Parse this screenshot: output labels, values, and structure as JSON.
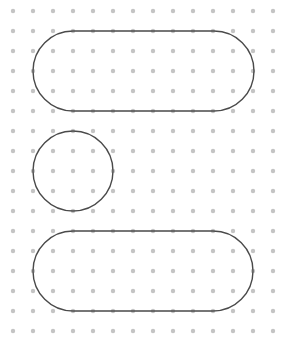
{
  "canvas": {
    "width": 287,
    "height": 346,
    "background": "#ffffff"
  },
  "grid": {
    "origin_x": 13,
    "origin_y": 11,
    "spacing": 20,
    "columns": 14,
    "rows": 17,
    "dot_radius": 2.2,
    "dot_color": "#c4c4c4"
  },
  "shapes": [
    {
      "type": "stadium",
      "name": "top-stadium",
      "x": 33,
      "y": 31,
      "width": 221,
      "height": 80,
      "stroke": "#4a4a4a",
      "stroke_width": 1.4
    },
    {
      "type": "circle",
      "name": "middle-circle",
      "cx": 73,
      "cy": 171,
      "r": 40,
      "stroke": "#4a4a4a",
      "stroke_width": 1.4
    },
    {
      "type": "stadium",
      "name": "bottom-stadium",
      "x": 33,
      "y": 231,
      "width": 220,
      "height": 80,
      "stroke": "#4a4a4a",
      "stroke_width": 1.4
    }
  ]
}
